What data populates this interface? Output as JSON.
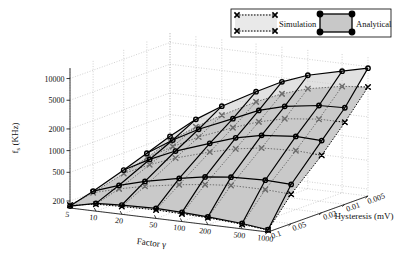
{
  "chart_data": {
    "type": "line",
    "render": "surface3d",
    "title": "",
    "xlabel": "Factor γ",
    "ylabel": "f_s (KHz)",
    "zlabel": "Hysteresis (mV)",
    "ylabel_base": "f",
    "ylabel_sub": "s",
    "ylabel_unit": " (KHz)",
    "x_ticks": [
      "5",
      "10",
      "20",
      "50",
      "100",
      "200",
      "500",
      "1000"
    ],
    "x_values": [
      5,
      10,
      20,
      50,
      100,
      200,
      500,
      1000
    ],
    "x_scale": "log",
    "z_ticks": [
      "0.1",
      "0.05",
      "0.02",
      "0.01",
      "0.005"
    ],
    "z_values": [
      0.1,
      0.05,
      0.02,
      0.01,
      0.005
    ],
    "z_scale": "log",
    "y_ticks": [
      "200",
      "500",
      "1000",
      "2000",
      "5000",
      "10000"
    ],
    "y_values": [
      200,
      500,
      1000,
      2000,
      5000,
      10000
    ],
    "y_scale": "log",
    "ylim": [
      160,
      14000
    ],
    "grid": true,
    "legend_position": "top-right",
    "series": [
      {
        "name": "Simulation",
        "marker": "x",
        "linestyle": "dotted",
        "color": "#000000",
        "surface_fill": "#c8c8c8",
        "grid_z": [
          {
            "hysteresis": 0.1,
            "values": [
              175,
              200,
              205,
              210,
              205,
              200,
              185,
              170
            ]
          },
          {
            "hysteresis": 0.05,
            "values": [
              200,
              250,
              300,
              360,
              400,
              430,
              430,
              410
            ]
          },
          {
            "hysteresis": 0.02,
            "values": [
              260,
              380,
              520,
              720,
              880,
              1000,
              1050,
              1000
            ]
          },
          {
            "hysteresis": 0.01,
            "values": [
              330,
              520,
              780,
              1200,
              1600,
              1950,
              2200,
              2200
            ]
          },
          {
            "hysteresis": 0.005,
            "values": [
              430,
              750,
              1200,
              2100,
              3000,
              3900,
              4800,
              5200
            ]
          }
        ]
      },
      {
        "name": "Analytical",
        "marker": "o",
        "linestyle": "solid",
        "color": "#000000",
        "surface_fill": "#c8c8c8",
        "grid_z": [
          {
            "hysteresis": 0.1,
            "values": [
              170,
              205,
              215,
              220,
              215,
              205,
              190,
              172
            ]
          },
          {
            "hysteresis": 0.05,
            "values": [
              210,
              280,
              350,
              440,
              510,
              560,
              580,
              560
            ]
          },
          {
            "hysteresis": 0.02,
            "values": [
              290,
              450,
              650,
              950,
              1250,
              1500,
              1650,
              1600
            ]
          },
          {
            "hysteresis": 0.01,
            "values": [
              380,
              640,
              1000,
              1600,
              2300,
              2900,
              3400,
              3500
            ]
          },
          {
            "hysteresis": 0.005,
            "values": [
              500,
              950,
              1600,
              2900,
              4400,
              6000,
              7800,
              9500
            ]
          }
        ]
      }
    ],
    "legend": [
      {
        "label": "Simulation",
        "marker": "x",
        "linestyle": "dotted"
      },
      {
        "label": "Analytical",
        "marker": "o",
        "linestyle": "solid"
      }
    ]
  },
  "axes": {
    "x_title": "Factor γ",
    "z_title": "Hysteresis (mV)",
    "y_title_main": "f",
    "y_title_sub": "s",
    "y_title_unit": "(KHz)"
  },
  "colors": {
    "surface": "#c8c8c8",
    "line": "#000000",
    "grid": "#aaaaaa",
    "background": "#ffffff",
    "legend_bg": "#ffffff"
  }
}
